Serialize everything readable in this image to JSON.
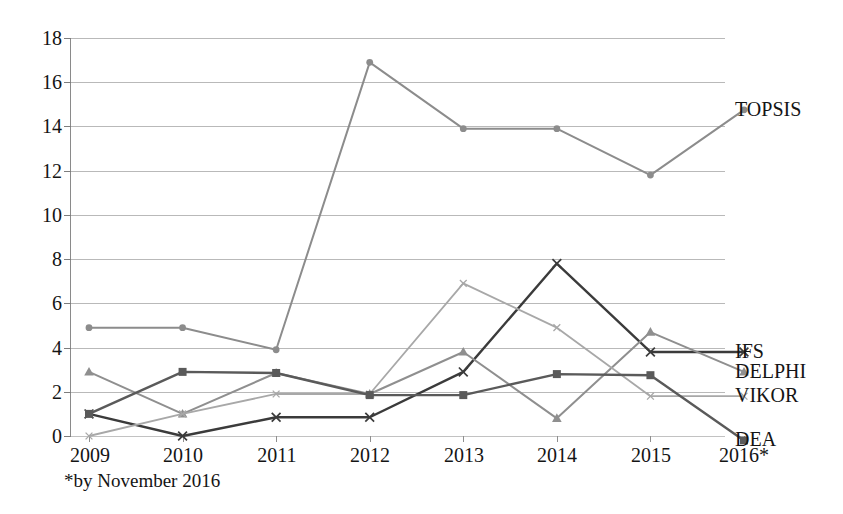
{
  "chart_data": {
    "type": "line",
    "title": "",
    "subtitle": "",
    "xlabel": "",
    "ylabel": "",
    "categories": [
      "2009",
      "2010",
      "2011",
      "2012",
      "2013",
      "2014",
      "2015",
      "2016*"
    ],
    "x": [
      2009,
      2010,
      2011,
      2012,
      2013,
      2014,
      2015,
      2016
    ],
    "ylim": [
      -1,
      18
    ],
    "yticks": [
      0,
      2,
      4,
      6,
      8,
      10,
      12,
      14,
      16,
      18
    ],
    "ytick_labels": [
      "0",
      "2",
      "4",
      "6",
      "8",
      "10",
      "12",
      "14",
      "16",
      "18"
    ],
    "grid": "horizontal",
    "legend_position": "right-inline-end-of-line",
    "annotations": [
      "*by November 2016"
    ],
    "series": [
      {
        "name": "TOPSIS",
        "marker": "circle",
        "color": "#8c8c8c",
        "values": [
          4.9,
          4.9,
          3.9,
          16.9,
          13.9,
          13.9,
          11.8,
          14.75
        ]
      },
      {
        "name": "IFS",
        "marker": "cross",
        "color": "#3b3b3b",
        "values": [
          1.0,
          0.0,
          0.85,
          0.85,
          2.9,
          7.8,
          3.8,
          3.8
        ]
      },
      {
        "name": "DELPHI",
        "marker": "triangle",
        "color": "#8f8f8f",
        "values": [
          2.9,
          1.0,
          2.85,
          1.9,
          3.8,
          0.8,
          4.7,
          2.9
        ]
      },
      {
        "name": "VIKOR",
        "marker": "cross-small",
        "color": "#a8a8a8",
        "values": [
          0.0,
          1.0,
          1.9,
          1.9,
          6.9,
          4.9,
          1.8,
          1.8
        ]
      },
      {
        "name": "DEA",
        "marker": "square",
        "color": "#5a5a5a",
        "values": [
          1.0,
          2.9,
          2.85,
          1.85,
          1.85,
          2.8,
          2.75,
          -0.2
        ]
      }
    ]
  },
  "axes": {
    "y_ticks": [
      "18",
      "16",
      "14",
      "12",
      "10",
      "8",
      "6",
      "4",
      "2",
      "0"
    ],
    "x_ticks": [
      "2009",
      "2010",
      "2011",
      "2012",
      "2013",
      "2014",
      "2015",
      "2016*"
    ]
  },
  "footnote": {
    "text": "*by November 2016"
  },
  "legend": {
    "items": [
      {
        "label": "TOPSIS"
      },
      {
        "label": "IFS"
      },
      {
        "label": "DELPHI"
      },
      {
        "label": "VIKOR"
      },
      {
        "label": "DEA"
      }
    ]
  },
  "colors": {
    "topsis": "#8c8c8c",
    "ifs": "#3b3b3b",
    "delphi": "#8f8f8f",
    "vikor": "#a8a8a8",
    "dea": "#5a5a5a",
    "grid": "#b9b9b9",
    "text": "#141414",
    "background": "#ffffff"
  }
}
